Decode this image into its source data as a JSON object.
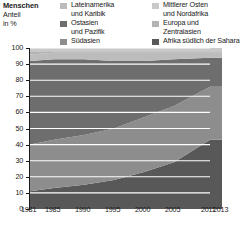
{
  "header": {
    "axis_title_line1": "Menschen",
    "axis_title_line2": "Anteil",
    "axis_title_line3": "in %"
  },
  "legend": {
    "position": "top",
    "columns": [
      {
        "items": [
          {
            "label_line1": "Lateinamerika",
            "label_line2": "und Karibik",
            "color": "#bcbcbc",
            "name": "latin-america-caribbean"
          },
          {
            "label_line1": "Ostasien",
            "label_line2": "und Pazifik",
            "color": "#6e6e6e",
            "name": "east-asia-pacific"
          },
          {
            "label_line1": "Südasien",
            "label_line2": "",
            "color": "#8d8d8d",
            "name": "south-asia"
          }
        ]
      },
      {
        "items": [
          {
            "label_line1": "Mittlerer Osten",
            "label_line2": "und Nordafrika",
            "color": "#c9c9c9",
            "name": "middle-east-north-africa"
          },
          {
            "label_line1": "Europa und",
            "label_line2": "Zentralasien",
            "color": "#b3b3b3",
            "name": "europe-central-asia"
          },
          {
            "label_line1": "Afrika südlich der Sahara",
            "label_line2": "",
            "color": "#585858",
            "name": "sub-saharan-africa"
          }
        ]
      }
    ]
  },
  "chart_data": {
    "type": "area",
    "stacked": true,
    "stack_mode": "percent",
    "title": "Menschen",
    "subtitle": "Anteil in %",
    "xlabel": "",
    "ylabel": "Anteil in %",
    "grid": true,
    "legend_position": "top",
    "x": [
      1981,
      1985,
      1990,
      1995,
      2000,
      2005,
      2011,
      2013
    ],
    "xlim": [
      1981,
      2013
    ],
    "xticks": [
      1981,
      1985,
      1990,
      1995,
      2000,
      2005,
      2011,
      2013
    ],
    "xtick_labels": [
      "1981",
      "1985",
      "1990",
      "1995",
      "2000",
      "2005",
      "2011",
      "2013"
    ],
    "ylim": [
      0,
      100
    ],
    "yticks": [
      0,
      10,
      20,
      30,
      40,
      50,
      60,
      70,
      80,
      90,
      100
    ],
    "ytick_labels": [
      "0",
      "10",
      "20",
      "30",
      "40",
      "50",
      "60",
      "70",
      "80",
      "90",
      "100"
    ],
    "data_end_year": 2011,
    "series": [
      {
        "name": "Afrika südlich der Sahara",
        "color": "#585858",
        "values": [
          11,
          13,
          15,
          18,
          23,
          29,
          43,
          43
        ]
      },
      {
        "name": "Südasien",
        "color": "#8d8d8d",
        "values": [
          29,
          30,
          31,
          32,
          34,
          35,
          33,
          33
        ]
      },
      {
        "name": "Ostasien und Pazifik",
        "color": "#6e6e6e",
        "values": [
          52,
          50,
          47,
          42,
          35,
          29,
          18,
          18
        ]
      },
      {
        "name": "Lateinamerika und Karibik",
        "color": "#bcbcbc",
        "values": [
          4,
          4,
          4,
          5,
          5,
          4,
          3,
          3
        ]
      },
      {
        "name": "Europa und Zentralasien",
        "color": "#b3b3b3",
        "values": [
          2,
          1,
          1,
          1,
          1,
          1,
          1,
          1
        ]
      },
      {
        "name": "Mittlerer Osten und Nordafrika",
        "color": "#c9c9c9",
        "values": [
          2,
          2,
          2,
          2,
          2,
          2,
          2,
          2
        ]
      }
    ]
  }
}
